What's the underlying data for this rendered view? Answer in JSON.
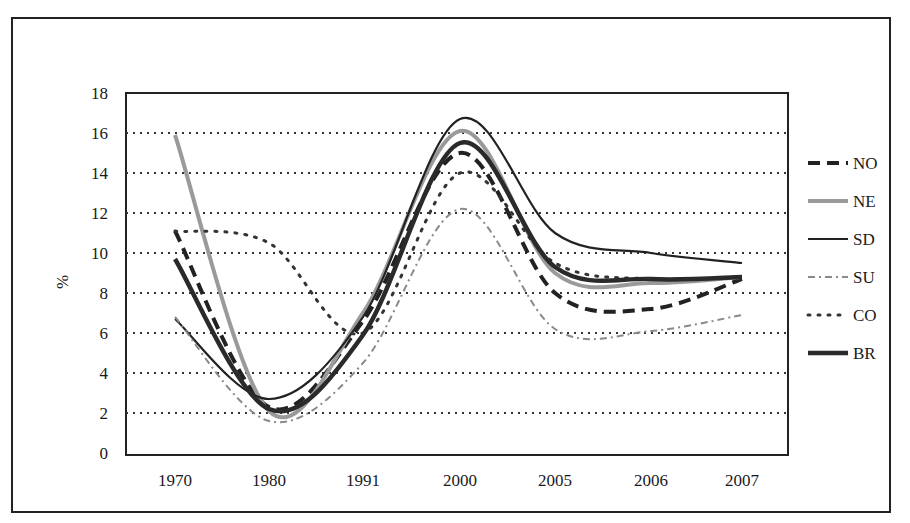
{
  "chart_data": {
    "type": "line",
    "title": "",
    "xlabel": "",
    "ylabel": "%",
    "ylim": [
      0,
      18
    ],
    "yticks": [
      0,
      2,
      4,
      6,
      8,
      10,
      12,
      14,
      16,
      18
    ],
    "grid": "horizontal dotted",
    "legend_position": "right",
    "categories": [
      "1970",
      "1980",
      "1991",
      "2000",
      "2005",
      "2006",
      "2007"
    ],
    "series": [
      {
        "name": "NO",
        "style": "dashed-thick",
        "values": [
          11.1,
          2.3,
          6.6,
          15.0,
          8.0,
          7.2,
          8.7
        ]
      },
      {
        "name": "NE",
        "style": "grey-hatched",
        "values": [
          15.9,
          2.1,
          7.0,
          16.1,
          9.0,
          8.5,
          8.8
        ]
      },
      {
        "name": "SD",
        "style": "solid-thin",
        "values": [
          6.7,
          2.7,
          6.8,
          16.7,
          11.0,
          10.0,
          9.5
        ]
      },
      {
        "name": "SU",
        "style": "grey-squiggle",
        "values": [
          6.8,
          1.6,
          4.5,
          12.2,
          6.2,
          6.1,
          6.9
        ]
      },
      {
        "name": "CO",
        "style": "dotted",
        "values": [
          11.1,
          10.5,
          6.0,
          14.0,
          9.5,
          8.7,
          8.8
        ]
      },
      {
        "name": "BR",
        "style": "solid-thick",
        "values": [
          9.7,
          2.2,
          5.9,
          15.5,
          9.3,
          8.7,
          8.8
        ]
      }
    ]
  },
  "legend": {
    "items": [
      {
        "label": "NO"
      },
      {
        "label": "NE"
      },
      {
        "label": "SD"
      },
      {
        "label": "SU"
      },
      {
        "label": "CO"
      },
      {
        "label": "BR"
      }
    ]
  },
  "axis": {
    "y_label": "%",
    "y_ticks": [
      "0",
      "2",
      "4",
      "6",
      "8",
      "10",
      "12",
      "14",
      "16",
      "18"
    ],
    "x_ticks": [
      "1970",
      "1980",
      "1991",
      "2000",
      "2005",
      "2006",
      "2007"
    ]
  }
}
